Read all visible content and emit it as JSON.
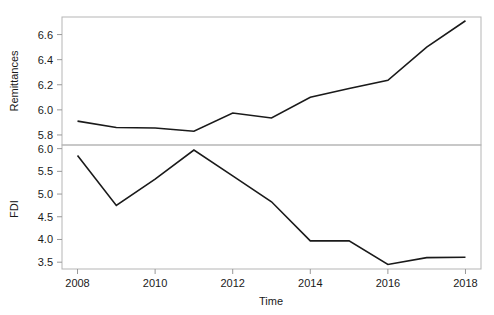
{
  "chart_data": {
    "type": "line",
    "title": "",
    "subtitle": "",
    "xlabel": "Time",
    "grid": false,
    "legend": "none",
    "panels": [
      {
        "name": "remittances-panel",
        "ylabel": "Remittances",
        "x": [
          2008,
          2009,
          2010,
          2011,
          2012,
          2013,
          2014,
          2015,
          2016,
          2017,
          2018
        ],
        "values": [
          5.91,
          5.86,
          5.855,
          5.83,
          5.975,
          5.935,
          6.1,
          6.17,
          6.235,
          6.5,
          6.71
        ],
        "ylim": [
          5.72,
          6.74
        ],
        "yticks": [
          5.8,
          6.0,
          6.2,
          6.4,
          6.6
        ],
        "yticklabels": [
          "5.8",
          "6.0",
          "6.2",
          "6.4",
          "6.6"
        ]
      },
      {
        "name": "fdi-panel",
        "ylabel": "FDI",
        "x": [
          2008,
          2009,
          2010,
          2011,
          2012,
          2013,
          2014,
          2015,
          2016,
          2017,
          2018
        ],
        "values": [
          5.85,
          4.75,
          5.33,
          5.97,
          5.4,
          4.83,
          3.97,
          3.97,
          3.45,
          3.6,
          3.61
        ],
        "ylim": [
          3.35,
          6.08
        ],
        "yticks": [
          3.5,
          4.0,
          4.5,
          5.0,
          5.5,
          6.0
        ],
        "yticklabels": [
          "3.5",
          "4.0",
          "4.5",
          "5.0",
          "5.5",
          "6.0"
        ]
      }
    ],
    "xlim": [
      2007.6,
      2018.4
    ],
    "xticks": [
      2008,
      2010,
      2012,
      2014,
      2016,
      2018
    ],
    "xticklabels": [
      "2008",
      "2010",
      "2012",
      "2014",
      "2016",
      "2018"
    ],
    "colors": {
      "line": "#1a1a1a",
      "axis": "#999999",
      "frame": "#b5b5b5",
      "background": "#ffffff"
    }
  }
}
